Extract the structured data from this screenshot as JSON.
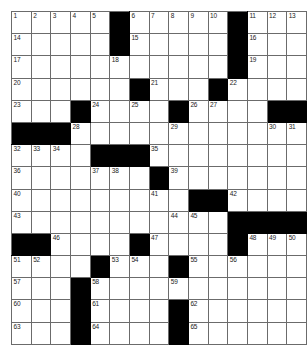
{
  "puzzle": {
    "type": "crossword-grid",
    "title": "Crossword Puzzle Grid",
    "columns": 13,
    "rows": 15,
    "colors": {
      "block": "#000000",
      "cell": "#ffffff",
      "gridline": "#6b6b6b",
      "number": "#1a1a1a",
      "background": "#ffffff"
    },
    "legend": {
      "white_cell": "fillable-letter-cell",
      "black_cell": "blocked-cell"
    },
    "grid": [
      [
        "1",
        "2",
        "3",
        "4",
        "5",
        "#",
        "6",
        "7",
        "8",
        "9",
        "10",
        "#",
        "11",
        "12",
        "13"
      ],
      [
        "14",
        "",
        "",
        "",
        "",
        "#",
        "15",
        "",
        "",
        "",
        "",
        "#",
        "16",
        "",
        ""
      ],
      [
        "17",
        "",
        "",
        "",
        "",
        "18",
        "",
        "",
        "",
        "",
        "",
        "#",
        "19",
        "",
        ""
      ],
      [
        "20",
        "",
        "",
        "",
        "",
        "",
        "#",
        "21",
        "",
        "",
        "#",
        "22",
        "",
        "",
        ""
      ],
      [
        "23",
        "",
        "",
        "#",
        "24",
        "",
        "25",
        "",
        "#",
        "26",
        "27",
        "",
        "",
        "#",
        "#"
      ]
    ],
    "layout_note": "13 columns wide, 15 rows tall; numbers run 1-65",
    "cells": [
      [
        {
          "n": "1",
          "b": false
        },
        {
          "n": "2",
          "b": false
        },
        {
          "n": "3",
          "b": false
        },
        {
          "n": "4",
          "b": false
        },
        {
          "n": "5",
          "b": false
        },
        {
          "n": "",
          "b": true
        },
        {
          "n": "6",
          "b": false
        },
        {
          "n": "7",
          "b": false
        },
        {
          "n": "8",
          "b": false
        },
        {
          "n": "9",
          "b": false
        },
        {
          "n": "10",
          "b": false
        },
        {
          "n": "",
          "b": true
        },
        {
          "n": "11",
          "b": false
        },
        {
          "n": "12",
          "b": false
        },
        {
          "n": "13",
          "b": false
        }
      ],
      [
        {
          "n": "14",
          "b": false
        },
        {
          "n": "",
          "b": false
        },
        {
          "n": "",
          "b": false
        },
        {
          "n": "",
          "b": false
        },
        {
          "n": "",
          "b": false
        },
        {
          "n": "",
          "b": true
        },
        {
          "n": "15",
          "b": false
        },
        {
          "n": "",
          "b": false
        },
        {
          "n": "",
          "b": false
        },
        {
          "n": "",
          "b": false
        },
        {
          "n": "",
          "b": false
        },
        {
          "n": "",
          "b": true
        },
        {
          "n": "16",
          "b": false
        },
        {
          "n": "",
          "b": false
        },
        {
          "n": "",
          "b": false
        }
      ],
      [
        {
          "n": "17",
          "b": false
        },
        {
          "n": "",
          "b": false
        },
        {
          "n": "",
          "b": false
        },
        {
          "n": "",
          "b": false
        },
        {
          "n": "",
          "b": false
        },
        {
          "n": "18",
          "b": false
        },
        {
          "n": "",
          "b": false
        },
        {
          "n": "",
          "b": false
        },
        {
          "n": "",
          "b": false
        },
        {
          "n": "",
          "b": false
        },
        {
          "n": "",
          "b": false
        },
        {
          "n": "",
          "b": true
        },
        {
          "n": "19",
          "b": false
        },
        {
          "n": "",
          "b": false
        },
        {
          "n": "",
          "b": false
        }
      ],
      [
        {
          "n": "20",
          "b": false
        },
        {
          "n": "",
          "b": false
        },
        {
          "n": "",
          "b": false
        },
        {
          "n": "",
          "b": false
        },
        {
          "n": "",
          "b": false
        },
        {
          "n": "",
          "b": false
        },
        {
          "n": "",
          "b": true
        },
        {
          "n": "21",
          "b": false
        },
        {
          "n": "",
          "b": false
        },
        {
          "n": "",
          "b": false
        },
        {
          "n": "",
          "b": true
        },
        {
          "n": "22",
          "b": false
        },
        {
          "n": "",
          "b": false
        },
        {
          "n": "",
          "b": false
        },
        {
          "n": "",
          "b": false
        }
      ],
      [
        {
          "n": "23",
          "b": false
        },
        {
          "n": "",
          "b": false
        },
        {
          "n": "",
          "b": false
        },
        {
          "n": "",
          "b": true
        },
        {
          "n": "24",
          "b": false
        },
        {
          "n": "",
          "b": false
        },
        {
          "n": "25",
          "b": false
        },
        {
          "n": "",
          "b": false
        },
        {
          "n": "",
          "b": true
        },
        {
          "n": "26",
          "b": false
        },
        {
          "n": "27",
          "b": false
        },
        {
          "n": "",
          "b": false
        },
        {
          "n": "",
          "b": false
        },
        {
          "n": "",
          "b": true
        },
        {
          "n": "",
          "b": true
        }
      ]
    ]
  },
  "grid_rows": [
    [
      {
        "n": "1"
      },
      {
        "n": "2"
      },
      {
        "n": "3"
      },
      {
        "n": "4"
      },
      {
        "n": "5"
      },
      {
        "blk": 1
      },
      {
        "n": "6"
      },
      {
        "n": "7"
      },
      {
        "n": "8"
      },
      {
        "n": "9"
      },
      {
        "n": "10"
      },
      {
        "blk": 1
      },
      {
        "n": "11"
      },
      {
        "n": "12"
      },
      {
        "n": "13"
      }
    ]
  ],
  "rows_spec": [
    {
      "index": 0,
      "cells": [
        {
          "num": "1"
        },
        {
          "num": "2"
        },
        {
          "num": "3"
        },
        {
          "num": "4"
        },
        {
          "num": "5"
        },
        {
          "black": true
        },
        {
          "num": "6"
        },
        {
          "num": "7"
        },
        {
          "num": "8"
        },
        {
          "num": "9"
        },
        {
          "num": "10"
        },
        {
          "black": true
        },
        {
          "num": "11"
        },
        {
          "num": "12"
        },
        {
          "num": "13"
        }
      ]
    }
  ],
  "board": [
    [
      {
        "num": "1"
      },
      {
        "num": "2"
      },
      {
        "num": "3"
      },
      {
        "num": "4"
      },
      {
        "num": "5"
      },
      {
        "black": true
      },
      {
        "num": "6"
      },
      {
        "num": "7"
      },
      {
        "num": "8"
      },
      {
        "num": "9"
      },
      {
        "num": "10"
      },
      {
        "black": true
      },
      {
        "num": "11"
      },
      {
        "num": "12"
      },
      {
        "num": "13"
      }
    ],
    [
      {
        "num": "14"
      },
      {},
      {},
      {},
      {},
      {
        "black": true
      },
      {
        "num": "15"
      },
      {},
      {},
      {},
      {},
      {
        "black": true
      },
      {
        "num": "16"
      },
      {},
      {}
    ],
    [
      {
        "num": "17"
      },
      {},
      {},
      {},
      {},
      {
        "num": "18"
      },
      {},
      {},
      {},
      {},
      {},
      {
        "black": true
      },
      {
        "num": "19"
      },
      {},
      {}
    ],
    [
      {
        "num": "20"
      },
      {},
      {},
      {},
      {},
      {},
      {
        "black": true
      },
      {
        "num": "21"
      },
      {},
      {},
      {
        "black": true
      },
      {
        "num": "22"
      },
      {},
      {},
      {}
    ],
    [
      {
        "num": "23"
      },
      {},
      {},
      {
        "black": true
      },
      {
        "num": "24"
      },
      {},
      {
        "num": "25"
      },
      {},
      {
        "black": true
      },
      {
        "num": "26"
      },
      {
        "num": "27"
      },
      {},
      {
        "black": true
      },
      {
        "black": true
      },
      {}
    ]
  ],
  "final_board": {
    "ncols": 13,
    "nrows": 15,
    "rows": [
      {
        "cells": [
          {
            "num": "1"
          },
          {
            "num": "2"
          },
          {
            "num": "3"
          },
          {
            "num": "4"
          },
          {
            "num": "5"
          },
          {
            "black": true
          },
          {
            "num": "6"
          },
          {
            "num": "7"
          },
          {
            "num": "8"
          },
          {
            "num": "9"
          },
          {
            "num": "10"
          },
          {
            "black": true
          },
          {
            "num": "11"
          },
          {
            "num": "12"
          },
          {
            "num": "13"
          }
        ]
      }
    ]
  },
  "rendered_grid": [
    [
      "1",
      "2",
      "3",
      "4",
      "5",
      "X",
      "6",
      "7",
      "8",
      "9",
      "10",
      "X",
      "11",
      "12",
      "13"
    ],
    [
      "14",
      "",
      "",
      "",
      "",
      "X",
      "15",
      "",
      "",
      "",
      "",
      "X",
      "16",
      "",
      ""
    ],
    [
      "17",
      "",
      "",
      "",
      "",
      "18",
      "",
      "",
      "",
      "",
      "",
      "X",
      "19",
      "",
      ""
    ],
    [
      "20",
      "",
      "",
      "",
      "",
      "",
      "X",
      "21",
      "",
      "",
      "X",
      "22",
      "",
      "",
      ""
    ],
    [
      "23",
      "",
      "",
      "X",
      "24",
      "",
      "25",
      "",
      "X",
      "26",
      "27",
      "",
      "X",
      "X",
      ""
    ],
    [
      "X",
      "X",
      "X",
      "28",
      "",
      "",
      "",
      "",
      "29",
      "",
      "",
      "",
      "",
      "30",
      "31"
    ],
    [
      "32",
      "33",
      "34",
      "",
      "X",
      "X",
      "35",
      "",
      "",
      "",
      "",
      "",
      "",
      ""
    ],
    [
      "36",
      "",
      "",
      "",
      "37",
      "38",
      "",
      "X",
      "39",
      "",
      "",
      "",
      "",
      ""
    ],
    [
      "40",
      "",
      "",
      "",
      "",
      "",
      "",
      "41",
      "",
      "X",
      "X",
      "42",
      "",
      ""
    ],
    [
      "43",
      "",
      "",
      "",
      "",
      "",
      "",
      "",
      "44",
      "45",
      "",
      "X",
      "X",
      "X"
    ],
    [
      "X",
      "X",
      "46",
      "",
      "",
      "",
      "X",
      "47",
      "",
      "",
      "",
      "X",
      "48",
      "49",
      "50"
    ],
    [
      "51",
      "52",
      "",
      "",
      "X",
      "53",
      "54",
      "",
      "X",
      "55",
      "",
      "56",
      "",
      ""
    ],
    [
      "57",
      "",
      "",
      "X",
      "58",
      "",
      "",
      "",
      "59",
      "",
      "",
      "",
      "",
      ""
    ],
    [
      "60",
      "",
      "",
      "X",
      "61",
      "",
      "",
      "",
      "X",
      "62",
      "",
      "",
      "",
      ""
    ],
    [
      "63",
      "",
      "",
      "X",
      "64",
      "",
      "",
      "",
      "X",
      "65",
      "",
      "",
      "",
      ""
    ]
  ],
  "grid_matrix": [
    [
      0,
      0,
      0,
      0,
      0,
      1,
      0,
      0,
      0,
      0,
      0,
      1,
      0,
      0,
      0
    ],
    [
      0,
      0,
      0,
      0,
      0,
      1,
      0,
      0,
      0,
      0,
      0,
      1,
      0,
      0,
      0
    ],
    [
      0,
      0,
      0,
      0,
      0,
      0,
      0,
      0,
      0,
      0,
      0,
      1,
      0,
      0,
      0
    ],
    [
      0,
      0,
      0,
      0,
      0,
      0,
      1,
      0,
      0,
      0,
      1,
      0,
      0,
      0,
      0
    ],
    [
      0,
      0,
      0,
      1,
      0,
      0,
      0,
      0,
      1,
      0,
      0,
      0,
      0,
      1,
      1
    ],
    [
      1,
      1,
      1,
      0,
      0,
      0,
      0,
      0,
      0,
      0,
      0,
      0,
      0,
      0,
      0
    ],
    [
      0,
      0,
      0,
      0,
      1,
      1,
      1,
      0,
      0,
      0,
      0,
      0,
      0,
      0,
      0
    ],
    [
      0,
      0,
      0,
      0,
      0,
      0,
      0,
      1,
      0,
      0,
      0,
      0,
      0,
      0,
      0
    ],
    [
      0,
      0,
      0,
      0,
      0,
      0,
      0,
      0,
      0,
      1,
      1,
      0,
      0,
      0,
      0
    ],
    [
      0,
      0,
      0,
      0,
      0,
      0,
      0,
      0,
      0,
      0,
      0,
      1,
      1,
      1,
      1
    ],
    [
      1,
      1,
      0,
      0,
      0,
      0,
      1,
      0,
      0,
      0,
      0,
      1,
      0,
      0,
      0
    ],
    [
      0,
      0,
      0,
      0,
      1,
      0,
      0,
      0,
      1,
      0,
      0,
      0,
      0,
      0,
      0
    ],
    [
      0,
      0,
      0,
      1,
      0,
      0,
      0,
      0,
      0,
      0,
      0,
      0,
      0,
      0,
      0
    ],
    [
      0,
      0,
      0,
      1,
      0,
      0,
      0,
      0,
      1,
      0,
      0,
      0,
      0,
      0,
      0
    ],
    [
      0,
      0,
      0,
      1,
      0,
      0,
      0,
      0,
      1,
      0,
      0,
      0,
      0,
      0,
      0
    ]
  ],
  "numbers_by_cell": {
    "0,0": "1",
    "0,1": "2",
    "0,2": "3",
    "0,3": "4",
    "0,4": "5",
    "0,6": "6",
    "0,7": "7",
    "0,8": "8",
    "0,9": "9",
    "0,10": "10",
    "0,12": "11",
    "0,13": "12",
    "0,14": "13",
    "1,0": "14",
    "1,6": "15",
    "1,12": "16",
    "2,0": "17",
    "2,5": "18",
    "2,12": "19",
    "3,0": "20",
    "3,7": "21",
    "3,11": "22",
    "4,0": "23",
    "4,4": "24",
    "4,6": "25",
    "4,9": "26",
    "4,10": "27",
    "5,3": "28",
    "5,8": "29",
    "5,13": "30",
    "5,14": "31",
    "6,0": "32",
    "6,1": "33",
    "6,2": "34",
    "6,7": "35",
    "7,0": "36",
    "7,4": "37",
    "7,5": "38",
    "7,8": "39",
    "8,0": "40",
    "8,7": "41",
    "8,11": "42",
    "9,0": "43",
    "9,8": "44",
    "9,9": "45",
    "10,2": "46",
    "10,7": "47",
    "10,12": "48",
    "10,13": "49",
    "10,14": "50",
    "11,0": "51",
    "11,1": "52",
    "11,5": "53",
    "11,6": "54",
    "11,9": "55",
    "11,11": "56",
    "12,0": "57",
    "12,4": "58",
    "12,8": "59",
    "13,0": "60",
    "13,4": "61",
    "13,9": "62",
    "14,0": "63",
    "14,4": "64",
    "14,9": "65"
  },
  "max_clue_number": "65"
}
